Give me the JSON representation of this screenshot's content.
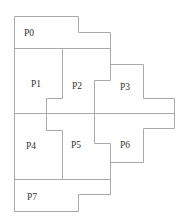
{
  "diagram": {
    "type": "partition-layout",
    "line_color": "#aaaaaa",
    "label_color": "#333333",
    "regions": [
      {
        "id": "P0",
        "label": "P0"
      },
      {
        "id": "P1",
        "label": "P1"
      },
      {
        "id": "P2",
        "label": "P2"
      },
      {
        "id": "P3",
        "label": "P3"
      },
      {
        "id": "P4",
        "label": "P4"
      },
      {
        "id": "P5",
        "label": "P5"
      },
      {
        "id": "P6",
        "label": "P6"
      },
      {
        "id": "P7",
        "label": "P7"
      }
    ]
  }
}
